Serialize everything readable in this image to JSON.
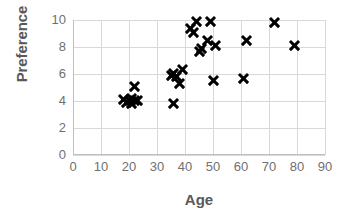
{
  "chart_data": {
    "type": "scatter",
    "title": "",
    "xlabel": "Age",
    "ylabel": "Preference",
    "xlim": [
      0,
      90
    ],
    "ylim": [
      0,
      10
    ],
    "xticks": [
      0,
      10,
      20,
      30,
      40,
      50,
      60,
      70,
      80,
      90
    ],
    "yticks": [
      0,
      2,
      4,
      6,
      8,
      10
    ],
    "grid": true,
    "legend": false,
    "marker": "x",
    "marker_color": "#000000",
    "series": [
      {
        "name": "Preference vs Age",
        "points": [
          {
            "x": 18,
            "y": 4.1
          },
          {
            "x": 19,
            "y": 3.9
          },
          {
            "x": 20,
            "y": 4.0
          },
          {
            "x": 21,
            "y": 3.8
          },
          {
            "x": 21,
            "y": 4.2
          },
          {
            "x": 22,
            "y": 4.0
          },
          {
            "x": 22,
            "y": 5.1
          },
          {
            "x": 23,
            "y": 4.0
          },
          {
            "x": 35,
            "y": 5.9
          },
          {
            "x": 36,
            "y": 3.8
          },
          {
            "x": 36,
            "y": 6.0
          },
          {
            "x": 37,
            "y": 5.8
          },
          {
            "x": 38,
            "y": 5.3
          },
          {
            "x": 39,
            "y": 6.3
          },
          {
            "x": 42,
            "y": 9.4
          },
          {
            "x": 43,
            "y": 9.1
          },
          {
            "x": 44,
            "y": 9.9
          },
          {
            "x": 45,
            "y": 7.7
          },
          {
            "x": 46,
            "y": 7.9
          },
          {
            "x": 48,
            "y": 8.5
          },
          {
            "x": 49,
            "y": 9.9
          },
          {
            "x": 50,
            "y": 5.5
          },
          {
            "x": 51,
            "y": 8.1
          },
          {
            "x": 61,
            "y": 5.7
          },
          {
            "x": 62,
            "y": 8.5
          },
          {
            "x": 72,
            "y": 9.8
          },
          {
            "x": 79,
            "y": 8.1
          }
        ]
      }
    ]
  },
  "axes": {
    "x_title": "Age",
    "y_title": "Preference",
    "x_tick_labels": [
      "0",
      "10",
      "20",
      "30",
      "40",
      "50",
      "60",
      "70",
      "80",
      "90"
    ],
    "y_tick_labels": [
      "0",
      "2",
      "4",
      "6",
      "8",
      "10"
    ]
  },
  "colors": {
    "marker": "#000000",
    "gridline": "#d9d9d9",
    "axis": "#bfbfbf",
    "tick_text": "#707070",
    "title_text": "#595959",
    "background": "#ffffff"
  }
}
